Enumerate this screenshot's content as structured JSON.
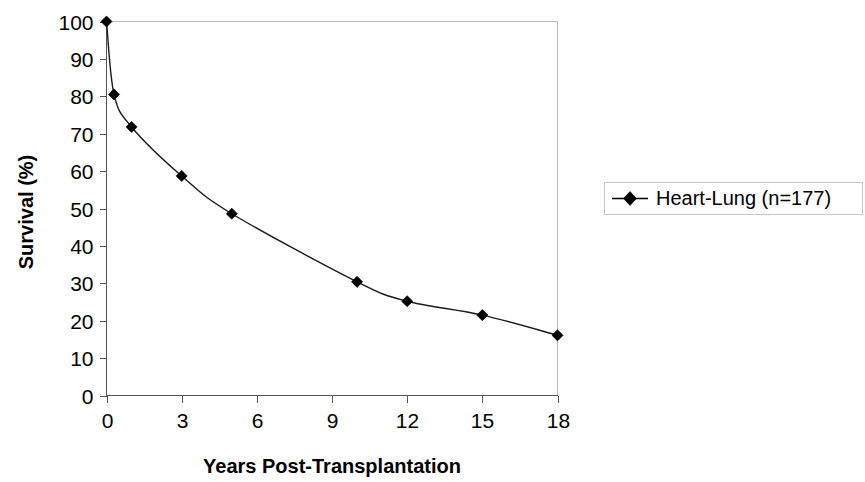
{
  "chart_data": {
    "type": "line",
    "title": "",
    "subtitle": "",
    "xlabel": "Years Post-Transplantation",
    "ylabel": "Survival (%)",
    "xlim": [
      0,
      18
    ],
    "ylim": [
      0,
      100
    ],
    "grid": false,
    "legend_position": "right",
    "xticks": [
      0,
      3,
      6,
      9,
      12,
      15,
      18
    ],
    "xtick_labels": [
      "0",
      "3",
      "6",
      "9",
      "12",
      "15",
      "18"
    ],
    "yticks": [
      0,
      10,
      20,
      30,
      40,
      50,
      60,
      70,
      80,
      90,
      100
    ],
    "ytick_labels": [
      "0",
      "10",
      "20",
      "30",
      "40",
      "50",
      "60",
      "70",
      "80",
      "90",
      "100"
    ],
    "series": [
      {
        "name": "Heart-Lung (n=177)",
        "marker": "diamond",
        "color": "#000000",
        "x": [
          0,
          0.3,
          1,
          3,
          5,
          10,
          12,
          15,
          18
        ],
        "values": [
          100,
          80.5,
          71.8,
          58.7,
          48.6,
          30.4,
          25.2,
          21.5,
          16.1
        ]
      }
    ]
  },
  "legend": {
    "entries": [
      {
        "label": "Heart-Lung (n=177)",
        "marker": "diamond-marker"
      }
    ]
  },
  "axes": {
    "x_title": "Years Post-Transplantation",
    "y_title": "Survival (%)"
  }
}
